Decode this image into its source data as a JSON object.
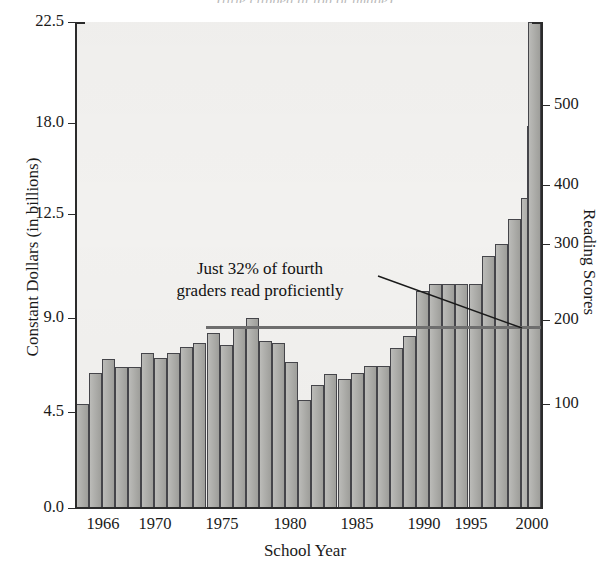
{
  "title": "(title clipped at top of image)",
  "axes": {
    "left": {
      "label": "Constant Dollars (in billions)",
      "ticks": [
        "0.0",
        "4.5",
        "9.0",
        "12.5",
        "18.0",
        "22.5"
      ]
    },
    "right": {
      "label": "Reading Scores",
      "ticks": [
        "100",
        "200",
        "300",
        "400",
        "500"
      ]
    },
    "bottom": {
      "label": "School Year",
      "ticks": [
        "1966",
        "1970",
        "1975",
        "1980",
        "1985",
        "1990",
        "1995",
        "2000"
      ]
    }
  },
  "annotation": {
    "line1": "Just 32% of fourth",
    "line2": "graders read proficiently"
  },
  "colors": {
    "bar_fill": "#a8a8a4",
    "bar_stroke": "#45454a",
    "plot_background": "#f2f1ef",
    "axis": "#2b2b2b",
    "score_line": "#6e6e6e",
    "text": "#1a1a1a"
  },
  "chart_data": {
    "type": "bar",
    "xlabel": "School Year",
    "ylabel": "Constant Dollars (in billions)",
    "y2label": "Reading Scores",
    "ylim": [
      0.0,
      22.5
    ],
    "y2lim": [
      0,
      560
    ],
    "grid": false,
    "legend": null,
    "categories": [
      1964,
      1965,
      1966,
      1967,
      1968,
      1969,
      1970,
      1971,
      1972,
      1973,
      1974,
      1975,
      1976,
      1977,
      1978,
      1979,
      1980,
      1981,
      1982,
      1983,
      1984,
      1985,
      1986,
      1987,
      1988,
      1989,
      1990,
      1991,
      1992,
      1993,
      1994,
      1995,
      1996,
      1997,
      1998,
      1999,
      2000
    ],
    "series": [
      {
        "name": "Constant Dollars (in billions)",
        "axis": "left",
        "values": [
          4.7,
          5.9,
          6.3,
          6.1,
          6.1,
          6.6,
          6.4,
          6.6,
          6.9,
          7.1,
          7.6,
          7.0,
          8.0,
          8.4,
          7.2,
          7.1,
          6.2,
          4.8,
          5.5,
          6.0,
          5.8,
          6.1,
          6.4,
          6.4,
          7.2,
          7.7,
          9.7,
          10.0,
          10.0,
          10.0,
          10.0,
          11.4,
          12.0,
          13.0,
          14.0,
          15.2,
          16.3
        ]
      },
      {
        "name": "Reading Scores",
        "axis": "right",
        "type": "line",
        "flat_value": 210,
        "x_start": 1974,
        "x_end": 1999,
        "note": "essentially flat over the period"
      }
    ],
    "annotations": [
      {
        "text": "Just 32% of fourth graders read proficiently",
        "points_to": "reading score line near 1998"
      }
    ]
  },
  "_geometry": {
    "plot": {
      "left": 75,
      "top": 22,
      "width": 467,
      "height": 486
    },
    "left_ticks_y": {
      "22.5": 0,
      "18.0": 101,
      "12.5": 192,
      "9.0": 296,
      "4.5": 390,
      "0.0": 486
    },
    "right_ticks_y": {
      "500": 83,
      "400": 163,
      "300": 222,
      "200": 298,
      "100": 382
    },
    "x_ticks_x": {
      "1966": 28,
      "1970": 80,
      "1975": 147,
      "1980": 215,
      "1985": 282,
      "1990": 349,
      "1995": 396,
      "2000": 457
    },
    "bar_px": [
      {
        "x": 0.5,
        "w": 13.0,
        "top": 382
      },
      {
        "x": 13.6,
        "w": 13.0,
        "top": 351
      },
      {
        "x": 26.7,
        "w": 13.0,
        "top": 337
      },
      {
        "x": 39.8,
        "w": 13.0,
        "top": 345
      },
      {
        "x": 52.9,
        "w": 13.0,
        "top": 345
      },
      {
        "x": 66.0,
        "w": 13.0,
        "top": 331
      },
      {
        "x": 79.1,
        "w": 13.0,
        "top": 336
      },
      {
        "x": 92.2,
        "w": 13.0,
        "top": 331
      },
      {
        "x": 105.3,
        "w": 13.0,
        "top": 325
      },
      {
        "x": 118.4,
        "w": 13.0,
        "top": 321
      },
      {
        "x": 131.5,
        "w": 13.0,
        "top": 311
      },
      {
        "x": 144.6,
        "w": 13.0,
        "top": 323
      },
      {
        "x": 157.7,
        "w": 13.0,
        "top": 304
      },
      {
        "x": 170.8,
        "w": 13.0,
        "top": 296
      },
      {
        "x": 183.9,
        "w": 13.0,
        "top": 319
      },
      {
        "x": 197.0,
        "w": 13.0,
        "top": 321
      },
      {
        "x": 210.1,
        "w": 13.0,
        "top": 340
      },
      {
        "x": 223.2,
        "w": 13.0,
        "top": 378
      },
      {
        "x": 236.3,
        "w": 13.0,
        "top": 363
      },
      {
        "x": 249.4,
        "w": 13.0,
        "top": 352
      },
      {
        "x": 262.5,
        "w": 13.0,
        "top": 357
      },
      {
        "x": 275.6,
        "w": 13.0,
        "top": 351
      },
      {
        "x": 288.7,
        "w": 13.0,
        "top": 344
      },
      {
        "x": 301.8,
        "w": 13.0,
        "top": 344
      },
      {
        "x": 314.9,
        "w": 13.0,
        "top": 326
      },
      {
        "x": 328.0,
        "w": 13.0,
        "top": 314
      },
      {
        "x": 341.1,
        "w": 13.0,
        "top": 269
      },
      {
        "x": 354.2,
        "w": 13.0,
        "top": 262
      },
      {
        "x": 367.3,
        "w": 13.0,
        "top": 262
      },
      {
        "x": 380.4,
        "w": 13.0,
        "top": 262
      },
      {
        "x": 393.5,
        "w": 13.0,
        "top": 262
      },
      {
        "x": 406.6,
        "w": 13.0,
        "top": 234
      },
      {
        "x": 419.7,
        "w": 13.0,
        "top": 222
      },
      {
        "x": 432.8,
        "w": 13.0,
        "top": 197
      },
      {
        "x": 445.9,
        "w": 13.0,
        "top": 176
      },
      {
        "x": 452.0,
        "w": 13.0,
        "top": 104
      },
      {
        "x": 453.0,
        "w": 13.0,
        "top": 0
      }
    ],
    "score_line": {
      "left": 206,
      "top": 326,
      "width": 335
    },
    "leader": {
      "x1": 378,
      "y1": 276,
      "x2": 522,
      "y2": 328
    }
  }
}
